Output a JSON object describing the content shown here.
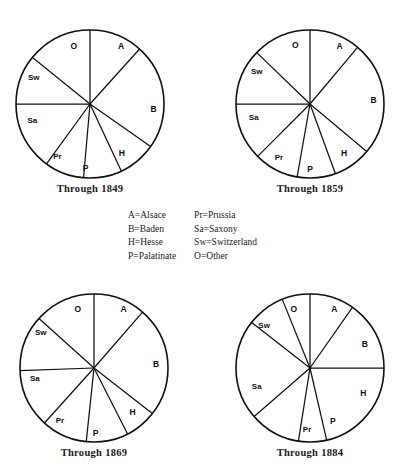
{
  "legend": {
    "left_column": [
      "A=Alsace",
      "B=Baden",
      "H=Hesse",
      "P=Palatinate"
    ],
    "right_column": [
      "Pr=Prussia",
      "Sa=Saxony",
      "Sw=Switzerland",
      "O=Other"
    ]
  },
  "chart_data": [
    {
      "type": "pie",
      "title": "Through 1849",
      "categories": [
        "A",
        "B",
        "H",
        "P",
        "Pr",
        "Sa",
        "Sw",
        "O"
      ],
      "values": [
        11.7,
        23.1,
        21.4,
        8.3,
        8.6,
        10.0,
        10.8,
        6.1
      ],
      "start_angle_deg": 0,
      "boundary_angles_deg": [
        0,
        42,
        125,
        155,
        185,
        216,
        270,
        309,
        360
      ],
      "labels": [
        "A",
        "B",
        "H",
        "P",
        "Pr",
        "Sa",
        "Sw",
        "O"
      ],
      "legend": "A=Alsace, B=Baden, H=Hesse, P=Palatinate, Pr=Prussia, Sa=Saxony, Sw=Switzerland, O=Other",
      "xlabel": "",
      "ylabel": ""
    },
    {
      "type": "pie",
      "title": "Through 1859",
      "categories": [
        "A",
        "B",
        "H",
        "P",
        "Pr",
        "Sa",
        "Sw",
        "O"
      ],
      "values": [
        11.1,
        25.0,
        19.4,
        8.3,
        9.7,
        12.5,
        8.3,
        5.7
      ],
      "start_angle_deg": 0,
      "boundary_angles_deg": [
        0,
        40,
        130,
        160,
        190,
        225,
        270,
        314,
        360
      ],
      "labels": [
        "A",
        "B",
        "H",
        "P",
        "Pr",
        "Sa",
        "Sw",
        "O"
      ],
      "legend": "A=Alsace, B=Baden, H=Hesse, P=Palatinate, Pr=Prussia, Sa=Saxony, Sw=Switzerland, O=Other",
      "xlabel": "",
      "ylabel": ""
    },
    {
      "type": "pie",
      "title": "Through 1869",
      "categories": [
        "A",
        "B",
        "H",
        "P",
        "Pr",
        "Sa",
        "Sw",
        "O"
      ],
      "values": [
        11.4,
        24.2,
        18.1,
        9.2,
        10.0,
        12.8,
        8.3,
        6.0
      ],
      "start_angle_deg": 0,
      "boundary_angles_deg": [
        0,
        41,
        128,
        153,
        186,
        222,
        268,
        312,
        360
      ],
      "labels": [
        "A",
        "B",
        "H",
        "P",
        "Pr",
        "Sa",
        "Sw",
        "O"
      ],
      "legend": "A=Alsace, B=Baden, H=Hesse, P=Palatinate, Pr=Prussia, Sa=Saxony, Sw=Switzerland, O=Other",
      "xlabel": "",
      "ylabel": ""
    },
    {
      "type": "pie",
      "title": "Through 1884",
      "categories": [
        "A",
        "B",
        "H",
        "P",
        "Pr",
        "Sa",
        "Sw",
        "O"
      ],
      "values": [
        9.7,
        15.3,
        21.4,
        6.1,
        11.1,
        21.9,
        8.3,
        6.2
      ],
      "start_angle_deg": 0,
      "boundary_angles_deg": [
        0,
        35,
        90,
        167,
        189,
        229,
        308,
        338,
        360
      ],
      "labels": [
        "A",
        "B",
        "H",
        "P",
        "Pr",
        "Sa",
        "Sw",
        "O"
      ],
      "legend": "A=Alsace, B=Baden, H=Hesse, P=Palatinate, Pr=Prussia, Sa=Saxony, Sw=Switzerland, O=Other",
      "xlabel": "",
      "ylabel": ""
    }
  ],
  "label_positions": [
    [
      {
        "t": "A",
        "x": 0.42,
        "y": -0.78
      },
      {
        "t": "B",
        "x": 0.86,
        "y": 0.07
      },
      {
        "t": "H",
        "x": 0.43,
        "y": 0.66
      },
      {
        "t": "P",
        "x": -0.06,
        "y": 0.86
      },
      {
        "t": "Pr",
        "x": -0.44,
        "y": 0.7
      },
      {
        "t": "Sa",
        "x": -0.78,
        "y": 0.22
      },
      {
        "t": "Sw",
        "x": -0.76,
        "y": -0.37
      },
      {
        "t": "O",
        "x": -0.22,
        "y": -0.79
      }
    ],
    [
      {
        "t": "A",
        "x": 0.4,
        "y": -0.79
      },
      {
        "t": "B",
        "x": 0.86,
        "y": -0.05
      },
      {
        "t": "H",
        "x": 0.46,
        "y": 0.66
      },
      {
        "t": "P",
        "x": 0.0,
        "y": 0.88
      },
      {
        "t": "Pr",
        "x": -0.42,
        "y": 0.72
      },
      {
        "t": "Sa",
        "x": -0.76,
        "y": 0.18
      },
      {
        "t": "Sw",
        "x": -0.72,
        "y": -0.45
      },
      {
        "t": "O",
        "x": -0.2,
        "y": -0.8
      }
    ],
    [
      {
        "t": "A",
        "x": 0.4,
        "y": -0.8
      },
      {
        "t": "B",
        "x": 0.84,
        "y": -0.05
      },
      {
        "t": "H",
        "x": 0.52,
        "y": 0.6
      },
      {
        "t": "P",
        "x": 0.02,
        "y": 0.88
      },
      {
        "t": "Pr",
        "x": -0.46,
        "y": 0.7
      },
      {
        "t": "Sa",
        "x": -0.8,
        "y": 0.14
      },
      {
        "t": "Sw",
        "x": -0.72,
        "y": -0.48
      },
      {
        "t": "O",
        "x": -0.22,
        "y": -0.8
      }
    ],
    [
      {
        "t": "A",
        "x": 0.33,
        "y": -0.8
      },
      {
        "t": "B",
        "x": 0.74,
        "y": -0.32
      },
      {
        "t": "H",
        "x": 0.72,
        "y": 0.34
      },
      {
        "t": "P",
        "x": 0.31,
        "y": 0.72
      },
      {
        "t": "Pr",
        "x": -0.04,
        "y": 0.83
      },
      {
        "t": "Sa",
        "x": -0.72,
        "y": 0.24
      },
      {
        "t": "Sw",
        "x": -0.62,
        "y": -0.58
      },
      {
        "t": "O",
        "x": -0.22,
        "y": -0.8
      }
    ]
  ],
  "layout": {
    "positions": [
      {
        "left": 2,
        "top": 22
      },
      {
        "left": 222,
        "top": 22
      },
      {
        "left": 6,
        "top": 286
      },
      {
        "left": 222,
        "top": 286
      }
    ],
    "radius": 74
  },
  "colors": {
    "stroke": "#111111",
    "fill": "#ffffff",
    "text": "#1a1a1a"
  }
}
